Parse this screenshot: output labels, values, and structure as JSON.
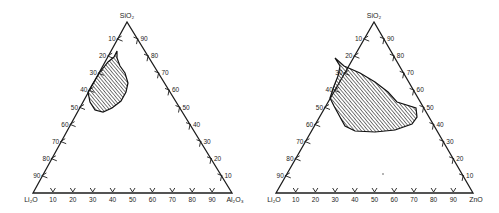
{
  "diagrams": [
    {
      "id": "li2o-al2o3-sio2",
      "vertices": {
        "top": {
          "label": "SiO2",
          "display": "SiO₂",
          "x": 127,
          "y": 22
        },
        "left": {
          "label": "Li2O",
          "display": "Li₂O",
          "x": 33,
          "y": 193
        },
        "right": {
          "label": "Al2O3",
          "display": "Al₂O₃",
          "x": 232,
          "y": 193
        }
      },
      "left_side_ticks": [
        "10",
        "20",
        "30",
        "40",
        "50",
        "60",
        "70",
        "80",
        "90"
      ],
      "right_side_ticks": [
        "90",
        "80",
        "70",
        "60",
        "50",
        "40",
        "30",
        "20",
        "10"
      ],
      "bottom_ticks": [
        "10",
        "20",
        "30",
        "40",
        "50",
        "60",
        "70",
        "80",
        "90"
      ],
      "shaded_region_outline": [
        [
          117,
          51
        ],
        [
          114,
          57
        ],
        [
          108,
          62
        ],
        [
          100,
          72
        ],
        [
          92,
          85
        ],
        [
          88,
          92
        ],
        [
          90,
          102
        ],
        [
          95,
          110
        ],
        [
          103,
          112
        ],
        [
          112,
          108
        ],
        [
          121,
          101
        ],
        [
          126,
          92
        ],
        [
          128,
          83
        ],
        [
          125,
          73
        ],
        [
          120,
          66
        ],
        [
          117,
          58
        ]
      ]
    },
    {
      "id": "li2o-zno-sio2",
      "vertices": {
        "top": {
          "label": "SiO2",
          "display": "SiO₂",
          "x": 374,
          "y": 22
        },
        "left": {
          "label": "Li2O",
          "display": "Li₂O",
          "x": 276,
          "y": 193
        },
        "right": {
          "label": "ZnO",
          "display": "ZnO",
          "x": 473,
          "y": 193
        }
      },
      "left_side_ticks": [
        "10",
        "20",
        "30",
        "40",
        "50",
        "60",
        "70",
        "80",
        "90"
      ],
      "right_side_ticks": [
        "90",
        "80",
        "70",
        "60",
        "50",
        "40",
        "30",
        "20",
        "10"
      ],
      "bottom_ticks": [
        "10",
        "20",
        "30",
        "40",
        "50",
        "60",
        "70",
        "80",
        "90"
      ],
      "shaded_region_outline": [
        [
          335,
          58
        ],
        [
          344,
          66
        ],
        [
          360,
          73
        ],
        [
          375,
          82
        ],
        [
          388,
          92
        ],
        [
          397,
          102
        ],
        [
          416,
          108
        ],
        [
          417,
          117
        ],
        [
          412,
          124
        ],
        [
          395,
          130
        ],
        [
          375,
          132
        ],
        [
          355,
          131
        ],
        [
          345,
          126
        ],
        [
          340,
          117
        ],
        [
          334,
          106
        ],
        [
          330,
          98
        ],
        [
          334,
          86
        ],
        [
          338,
          76
        ],
        [
          340,
          66
        ]
      ]
    }
  ]
}
